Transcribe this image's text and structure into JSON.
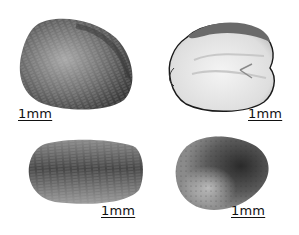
{
  "figure": {
    "panels": [
      {
        "id": "top-left",
        "description": "seed exterior, lateral view",
        "scale_label": "1mm"
      },
      {
        "id": "top-right",
        "description": "seed cut open showing white interior",
        "scale_label": "1mm"
      },
      {
        "id": "bottom-left",
        "description": "seed exterior, elongated view",
        "scale_label": "1mm"
      },
      {
        "id": "bottom-right",
        "description": "seed exterior, rounded view",
        "scale_label": "1mm"
      }
    ]
  },
  "colors": {
    "background": "#ffffff",
    "seed_dark": "#3a3a3a",
    "seed_mid": "#7a7a7a",
    "seed_light": "#b5b5b5",
    "interior": "#eeeeee",
    "label": "#111111"
  }
}
